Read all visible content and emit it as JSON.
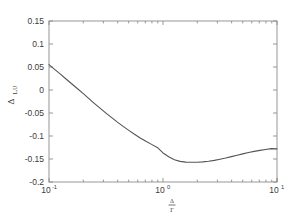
{
  "chart_data": {
    "type": "line",
    "title": "",
    "subtitle": "",
    "xlabel": "Δ/Γ",
    "xlabel_numerator": "Δ",
    "xlabel_denominator": "Γ",
    "ylabel": "Δ",
    "ylabel_subscript": "L,U",
    "ylabel_full": "Δ_L,U",
    "xscale": "log",
    "yscale": "linear",
    "xlim": [
      0.1,
      10
    ],
    "ylim": [
      -0.2,
      0.15
    ],
    "grid": false,
    "legend": null,
    "legend_position": "none",
    "x_tick_labels": [
      "10⁻¹",
      "10⁰",
      "10¹"
    ],
    "x_tick_bases": [
      "10",
      "10",
      "10"
    ],
    "x_tick_exponents": [
      "-1",
      "0",
      "1"
    ],
    "x_tick_values": [
      0.1,
      1,
      10
    ],
    "y_tick_labels": [
      "0.15",
      "0.1",
      "0.05",
      "0",
      "-0.05",
      "-0.1",
      "-0.15",
      "-0.2"
    ],
    "y_tick_values": [
      0.15,
      0.1,
      0.05,
      0,
      -0.05,
      -0.1,
      -0.15,
      -0.2
    ],
    "line_color": "#555555",
    "line_width": 1.1,
    "axis_color": "#8c8c8c",
    "series": [
      {
        "name": "Delta_LU",
        "x": [
          0.1,
          0.112,
          0.126,
          0.141,
          0.158,
          0.178,
          0.2,
          0.224,
          0.251,
          0.282,
          0.316,
          0.355,
          0.398,
          0.447,
          0.501,
          0.562,
          0.631,
          0.708,
          0.794,
          0.891,
          1.0,
          1.122,
          1.259,
          1.413,
          1.585,
          1.778,
          1.995,
          2.239,
          2.512,
          2.818,
          3.162,
          3.548,
          3.981,
          4.467,
          5.012,
          5.623,
          6.31,
          7.079,
          7.943,
          8.913,
          10.0
        ],
        "values": [
          0.055,
          0.0448,
          0.0345,
          0.024,
          0.0135,
          0.0028,
          -0.008,
          -0.0188,
          -0.0295,
          -0.04,
          -0.0502,
          -0.0602,
          -0.0698,
          -0.079,
          -0.0878,
          -0.0962,
          -0.1042,
          -0.1115,
          -0.1182,
          -0.1248,
          -0.1368,
          -0.1452,
          -0.1518,
          -0.1552,
          -0.1568,
          -0.1572,
          -0.157,
          -0.1562,
          -0.1548,
          -0.153,
          -0.1505,
          -0.1478,
          -0.1448,
          -0.1418,
          -0.1388,
          -0.136,
          -0.1335,
          -0.1312,
          -0.1292,
          -0.1275,
          -0.128
        ]
      }
    ]
  },
  "figure": {
    "background_color": "#ffffff",
    "plot_left": 49,
    "plot_right": 277,
    "plot_top": 21,
    "plot_bottom": 182
  }
}
